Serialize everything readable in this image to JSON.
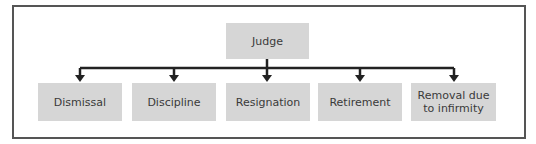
{
  "diagram": {
    "type": "tree",
    "root": {
      "label": "Judge"
    },
    "children": [
      {
        "label": "Dismissal"
      },
      {
        "label": "Discipline"
      },
      {
        "label": "Resignation"
      },
      {
        "label": "Retirement"
      },
      {
        "label": "Removal due to infirmity",
        "line1": "Removal due",
        "line2": "to infirmity"
      }
    ],
    "colors": {
      "box_fill": "#d6d6d6",
      "line": "#222222",
      "frame": "#555555",
      "text": "#3a3a3a"
    }
  }
}
